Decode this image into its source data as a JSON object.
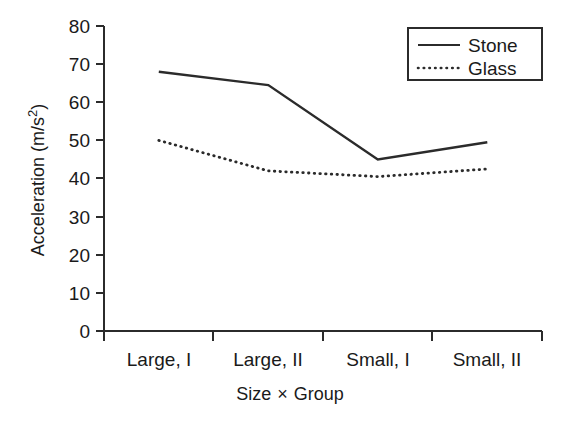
{
  "chart_data": {
    "type": "line",
    "title": "",
    "xlabel": "Size × Group",
    "ylabel": "Acceleration (m/s²)",
    "categories": [
      "Large, I",
      "Large, II",
      "Small, I",
      "Small, II"
    ],
    "series": [
      {
        "name": "Stone",
        "values": [
          68,
          64.5,
          45,
          49.5
        ],
        "style": "solid"
      },
      {
        "name": "Glass",
        "values": [
          50,
          42,
          40.5,
          42.5
        ],
        "style": "dotted"
      }
    ],
    "ylim": [
      0,
      80
    ],
    "ytick_values": [
      0,
      10,
      20,
      30,
      40,
      50,
      60,
      70,
      80
    ],
    "ytick_labels": [
      "0",
      "10",
      "20",
      "30",
      "40",
      "50",
      "60",
      "70",
      "80"
    ],
    "grid": false,
    "legend_position": "top-right",
    "legend_entries": [
      "Stone",
      "Glass"
    ],
    "accent_color": "#2b2b2b",
    "background_color": "#ffffff"
  },
  "axes": {
    "y_label_main": "Acceleration (m/s",
    "y_label_sup": "2",
    "y_label_close": ")",
    "x_label_part1": "Size",
    "x_label_times": "×",
    "x_label_part2": "Group"
  }
}
